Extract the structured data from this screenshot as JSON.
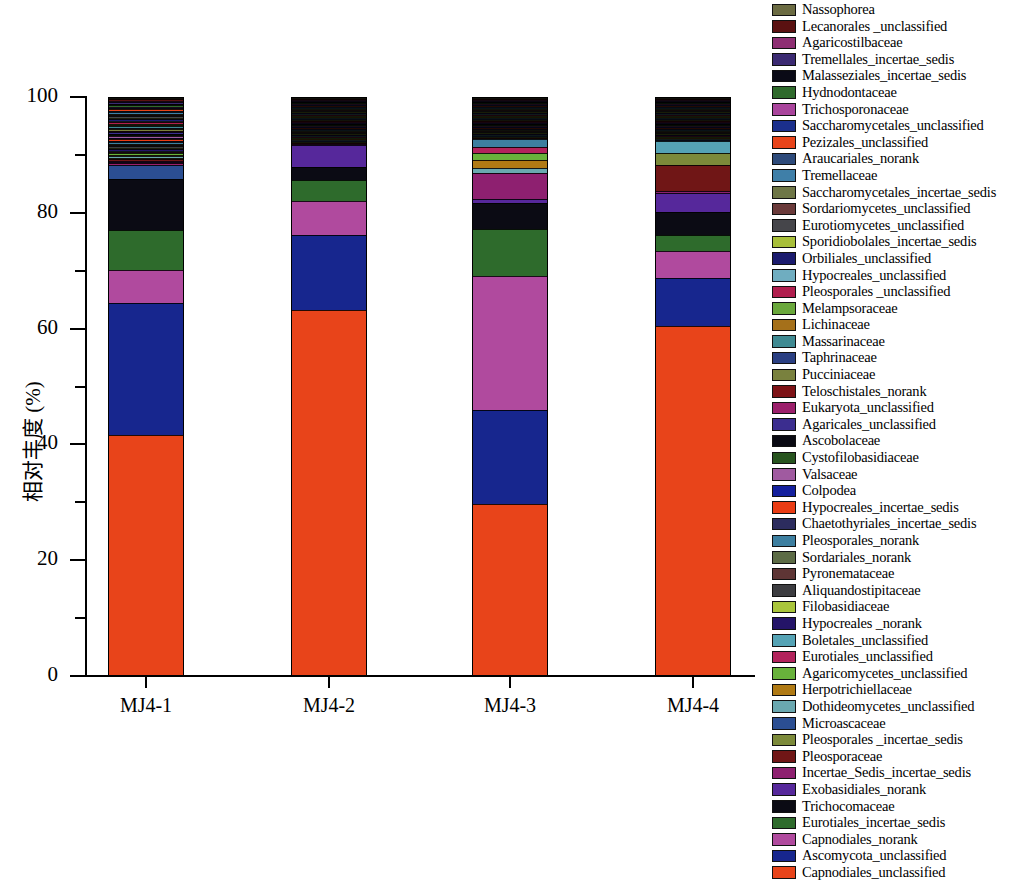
{
  "chart_data": {
    "type": "bar",
    "stacked": true,
    "title": "",
    "xlabel": "",
    "ylabel": "相对丰度 (%)",
    "ylim": [
      0,
      100
    ],
    "yticks_major": [
      0,
      20,
      40,
      60,
      80,
      100
    ],
    "yticks_minor": [
      10,
      30,
      50,
      70,
      90
    ],
    "grid": false,
    "legend_position": "right",
    "categories": [
      "MJ4-1",
      "MJ4-2",
      "MJ4-3",
      "MJ4-4"
    ],
    "series": [
      {
        "name": "Nassophorea",
        "color": "#6b6b42",
        "values": [
          0.0,
          0.0,
          0.0,
          0.0
        ]
      },
      {
        "name": "Lecanorales _unclassified",
        "color": "#5a1111",
        "values": [
          0.0,
          0.0,
          0.0,
          0.0
        ]
      },
      {
        "name": "Agaricostilbaceae",
        "color": "#8e2e73",
        "values": [
          0.0,
          0.0,
          0.0,
          0.0
        ]
      },
      {
        "name": "Tremellales_incertae_sedis",
        "color": "#3b2a72",
        "values": [
          0.0,
          0.0,
          0.0,
          0.0
        ]
      },
      {
        "name": "Malasseziales_incertae_sedis",
        "color": "#0a0a16",
        "values": [
          0.0,
          0.0,
          0.0,
          0.0
        ]
      },
      {
        "name": "Hydnodontaceae",
        "color": "#2f6a2c",
        "values": [
          0.0,
          0.0,
          0.0,
          0.0
        ]
      },
      {
        "name": "Trichosporonaceae",
        "color": "#a9449c",
        "values": [
          0.0,
          0.0,
          0.0,
          0.0
        ]
      },
      {
        "name": "Saccharomycetales_unclassified",
        "color": "#1b2f8c",
        "values": [
          0.0,
          0.0,
          0.0,
          0.0
        ]
      },
      {
        "name": "Pezizales_unclassified",
        "color": "#e8441a",
        "values": [
          0.0,
          0.0,
          0.0,
          0.0
        ]
      },
      {
        "name": "Araucariales_norank",
        "color": "#2d4a7a",
        "values": [
          0.0,
          0.0,
          0.0,
          0.0
        ]
      },
      {
        "name": "Tremellaceae",
        "color": "#3f7fa8",
        "values": [
          0.0,
          0.0,
          0.0,
          0.0
        ]
      },
      {
        "name": "Saccharomycetales_incertae_sedis",
        "color": "#6e7646",
        "values": [
          0.0,
          0.0,
          0.0,
          0.0
        ]
      },
      {
        "name": "Sordariomycetes_unclassified",
        "color": "#6a3a3a",
        "values": [
          0.0,
          0.0,
          0.0,
          0.0
        ]
      },
      {
        "name": "Eurotiomycetes_unclassified",
        "color": "#45454a",
        "values": [
          0.0,
          0.0,
          0.0,
          0.0
        ]
      },
      {
        "name": "Sporidiobolales_incertae_sedis",
        "color": "#a8bf3a",
        "values": [
          0.0,
          0.0,
          0.0,
          0.0
        ]
      },
      {
        "name": "Orbiliales_unclassified",
        "color": "#1b1b6e",
        "values": [
          0.0,
          0.0,
          0.0,
          0.0
        ]
      },
      {
        "name": "Hypocreales_unclassified",
        "color": "#6fadc0",
        "values": [
          0.0,
          0.0,
          0.0,
          0.0
        ]
      },
      {
        "name": "Pleosporales _unclassified",
        "color": "#b01e4e",
        "values": [
          0.0,
          0.0,
          0.0,
          0.0
        ]
      },
      {
        "name": "Melampsoraceae",
        "color": "#6aa83c",
        "values": [
          0.0,
          0.0,
          0.0,
          0.0
        ]
      },
      {
        "name": "Lichinaceae",
        "color": "#a5701a",
        "values": [
          0.0,
          0.0,
          0.0,
          0.0
        ]
      },
      {
        "name": "Massarinaceae",
        "color": "#3f8a92",
        "values": [
          0.0,
          0.0,
          0.0,
          0.0
        ]
      },
      {
        "name": "Taphrinaceae",
        "color": "#2a3f82",
        "values": [
          0.0,
          0.0,
          0.0,
          0.0
        ]
      },
      {
        "name": "Pucciniaceae",
        "color": "#79813e",
        "values": [
          0.0,
          0.0,
          0.0,
          0.0
        ]
      },
      {
        "name": "Teloschistales_norank",
        "color": "#7d1216",
        "values": [
          0.0,
          0.0,
          0.0,
          0.0
        ]
      },
      {
        "name": "Eukaryota_unclassified",
        "color": "#9b1f6b",
        "values": [
          0.3,
          0.0,
          0.0,
          0.0
        ]
      },
      {
        "name": "Agaricales_unclassified",
        "color": "#3b2d8f",
        "values": [
          0.0,
          0.0,
          0.0,
          0.0
        ]
      },
      {
        "name": "Ascobolaceae",
        "color": "#090912",
        "values": [
          0.0,
          0.0,
          0.0,
          0.0
        ]
      },
      {
        "name": "Cystofilobasidiaceae",
        "color": "#27541f",
        "values": [
          0.0,
          0.0,
          0.0,
          0.0
        ]
      },
      {
        "name": "Valsaceae",
        "color": "#a05aa0",
        "values": [
          0.0,
          0.0,
          0.0,
          0.0
        ]
      },
      {
        "name": "Colpodea",
        "color": "#14209e",
        "values": [
          0.0,
          0.0,
          0.0,
          0.0
        ]
      },
      {
        "name": "Hypocreales_incertae_sedis",
        "color": "#ea3c14",
        "values": [
          0.0,
          0.0,
          0.0,
          0.0
        ]
      },
      {
        "name": "Chaetothyriales_incertae_sedis",
        "color": "#2c2c5e",
        "values": [
          0.0,
          0.0,
          0.0,
          0.0
        ]
      },
      {
        "name": "Pleosporales_norank",
        "color": "#3d7fa0",
        "values": [
          0.0,
          0.0,
          1.3,
          0.0
        ]
      },
      {
        "name": "Sordariales_norank",
        "color": "#5c6b45",
        "values": [
          0.0,
          0.0,
          0.0,
          0.0
        ]
      },
      {
        "name": "Pyronemataceae",
        "color": "#5e3535",
        "values": [
          0.0,
          0.0,
          0.0,
          0.0
        ]
      },
      {
        "name": "Aliquandostipitaceae",
        "color": "#3c3c40",
        "values": [
          0.0,
          0.0,
          0.0,
          0.0
        ]
      },
      {
        "name": "Filobasidiaceae",
        "color": "#a9c53b",
        "values": [
          0.0,
          0.0,
          0.0,
          0.0
        ]
      },
      {
        "name": "Hypocreales _norank",
        "color": "#241468",
        "values": [
          0.0,
          0.0,
          0.0,
          0.0
        ]
      },
      {
        "name": "Boletales_unclassified",
        "color": "#55a3b5",
        "values": [
          0.0,
          0.0,
          0.0,
          2.0
        ]
      },
      {
        "name": "Eurotiales_unclassified",
        "color": "#b2235c",
        "values": [
          0.0,
          0.0,
          1.2,
          0.0
        ]
      },
      {
        "name": "Agaricomycetes_unclassified",
        "color": "#68b23b",
        "values": [
          0.0,
          0.0,
          1.2,
          0.0
        ]
      },
      {
        "name": "Herpotrichiellaceae",
        "color": "#b07a14",
        "values": [
          0.0,
          0.0,
          1.3,
          0.0
        ]
      },
      {
        "name": "Dothideomycetes_unclassified",
        "color": "#6aa8b0",
        "values": [
          0.0,
          0.0,
          0.8,
          0.0
        ]
      },
      {
        "name": "Microascaceae",
        "color": "#2b4e92",
        "values": [
          2.4,
          0.0,
          0.0,
          0.0
        ]
      },
      {
        "name": "Pleosporales _incertae_sedis",
        "color": "#7c8a3a",
        "values": [
          0.0,
          0.0,
          0.0,
          2.2
        ]
      },
      {
        "name": "Pleosporaceae",
        "color": "#701616",
        "values": [
          0.0,
          0.0,
          0.0,
          4.5
        ]
      },
      {
        "name": "Incertae_Sedis_incertae_sedis",
        "color": "#8e2070",
        "values": [
          0.0,
          0.0,
          4.5,
          0.3
        ]
      },
      {
        "name": "Exobasidiales_norank",
        "color": "#56289b",
        "values": [
          0.0,
          3.8,
          0.8,
          3.3
        ]
      },
      {
        "name": "Trichocomaceae",
        "color": "#0b0b14",
        "values": [
          8.8,
          2.2,
          4.5,
          4.0
        ]
      },
      {
        "name": "Eurotiales_incertae_sedis",
        "color": "#2e6b2c",
        "values": [
          7.0,
          3.6,
          8.0,
          2.7
        ]
      },
      {
        "name": "Capnodiales_norank",
        "color": "#b04a9e",
        "values": [
          5.7,
          5.9,
          23.2,
          4.7
        ]
      },
      {
        "name": "Ascomycota_unclassified",
        "color": "#17268e",
        "values": [
          22.7,
          13.0,
          16.2,
          8.3
        ]
      },
      {
        "name": "Capnodiales_unclassified",
        "color": "#e8441a",
        "values": [
          41.7,
          64.2,
          32.3,
          67.0
        ]
      }
    ]
  },
  "axis": {
    "y_tick_labels": [
      "100",
      "80",
      "60",
      "40",
      "20",
      "0"
    ],
    "y_axis_title": "相对丰度 (%)"
  }
}
